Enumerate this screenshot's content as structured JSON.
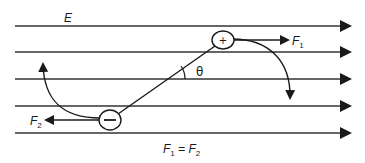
{
  "diagram": {
    "field_label": "E",
    "field_lines": [
      26,
      52,
      79,
      106,
      133
    ],
    "positive_charge": {
      "symbol": "+",
      "force_label": "F",
      "force_sub": "1"
    },
    "negative_charge": {
      "symbol": "−",
      "force_label": "F",
      "force_sub": "2"
    },
    "angle_label": "θ",
    "equation": {
      "lhs": "F",
      "lhs_sub": "1",
      "eq": " = ",
      "rhs": "F",
      "rhs_sub": "2"
    },
    "colors": {
      "ink": "#1a1a1a",
      "line": "#333333",
      "background": "#ffffff"
    }
  }
}
